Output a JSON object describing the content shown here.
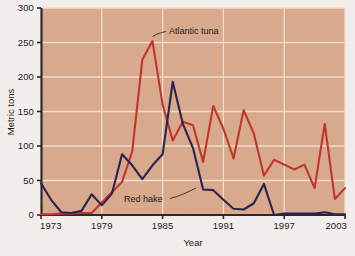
{
  "chart_data": {
    "type": "line",
    "title": "",
    "xlabel": "Year",
    "ylabel": "Metric tons",
    "xlim": [
      1973,
      2003
    ],
    "ylim": [
      0,
      300
    ],
    "grid": true,
    "legend_position": "inline-annotation",
    "xticks": [
      "1973",
      "1979",
      "1985",
      "1991",
      "1997",
      "2003"
    ],
    "xtick_values": [
      1973,
      1979,
      1985,
      1991,
      1997,
      2003
    ],
    "yticks": [
      "0",
      "50",
      "100",
      "150",
      "200",
      "250",
      "300"
    ],
    "ytick_values": [
      0,
      50,
      100,
      150,
      200,
      250,
      300
    ],
    "x": [
      1973,
      1974,
      1975,
      1976,
      1977,
      1978,
      1979,
      1980,
      1981,
      1982,
      1983,
      1984,
      1985,
      1986,
      1987,
      1988,
      1989,
      1990,
      1991,
      1992,
      1993,
      1994,
      1995,
      1996,
      1997,
      1998,
      1999,
      2000,
      2001,
      2002,
      2003
    ],
    "series": [
      {
        "name": "Atlantic tuna",
        "color": "#c0362c",
        "values": [
          1,
          1,
          2,
          2,
          3,
          3,
          18,
          33,
          48,
          92,
          225,
          252,
          160,
          108,
          135,
          130,
          77,
          158,
          125,
          82,
          152,
          118,
          57,
          80,
          73,
          66,
          73,
          39,
          132,
          23,
          39
        ]
      },
      {
        "name": "Red hake",
        "color": "#2b2350",
        "values": [
          46,
          22,
          4,
          3,
          6,
          30,
          14,
          31,
          88,
          72,
          52,
          72,
          88,
          193,
          132,
          97,
          37,
          36,
          22,
          9,
          8,
          17,
          45,
          0,
          2,
          2,
          2,
          2,
          4,
          1,
          1
        ]
      }
    ],
    "annotations": [
      {
        "label": "Atlantic tuna",
        "series": "Atlantic tuna",
        "points_to_year": 1984,
        "points_to_value": 252
      },
      {
        "label": "Red hake",
        "series": "Red hake",
        "points_to_year": 1989,
        "points_to_value": 37
      }
    ],
    "colors": {
      "plot_background": "#d8a98c",
      "gridline": "#f0ddcd",
      "axis": "#2b2a29",
      "page_background": "#f1eeec",
      "atlantic_tuna": "#c0362c",
      "red_hake": "#2b2350"
    }
  }
}
